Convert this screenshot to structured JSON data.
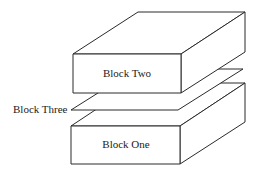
{
  "diagram": {
    "type": "stacked-blocks-isometric",
    "blocks": [
      {
        "id": "block-one",
        "label": "Block One",
        "position": "bottom"
      },
      {
        "id": "block-three",
        "label": "Block Three",
        "position": "middle",
        "shape": "thin sheet"
      },
      {
        "id": "block-two",
        "label": "Block Two",
        "position": "top"
      }
    ],
    "colors": {
      "stroke": "#2a2a2a",
      "fill": "#ffffff",
      "text": "#222222"
    }
  }
}
